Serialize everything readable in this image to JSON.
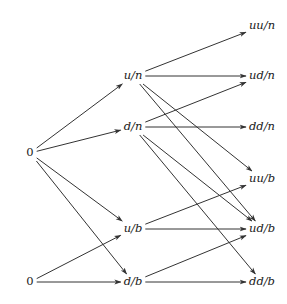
{
  "diagram": {
    "type": "directed-graph",
    "columns": 3,
    "nodes": [
      {
        "id": "root_top",
        "label": "0",
        "x": 30,
        "y": 153,
        "column": 0
      },
      {
        "id": "root_bottom",
        "label": "0",
        "x": 30,
        "y": 282,
        "column": 0
      },
      {
        "id": "u_n",
        "label": "u/n",
        "x": 133,
        "y": 76,
        "column": 1
      },
      {
        "id": "d_n",
        "label": "d/n",
        "x": 133,
        "y": 127,
        "column": 1
      },
      {
        "id": "u_b",
        "label": "u/b",
        "x": 133,
        "y": 229,
        "column": 1
      },
      {
        "id": "d_b",
        "label": "d/b",
        "x": 133,
        "y": 282,
        "column": 1
      },
      {
        "id": "uu_n",
        "label": "uu/n",
        "x": 262,
        "y": 26,
        "column": 2
      },
      {
        "id": "ud_n",
        "label": "ud/n",
        "x": 262,
        "y": 76,
        "column": 2
      },
      {
        "id": "dd_n",
        "label": "dd/n",
        "x": 262,
        "y": 127,
        "column": 2
      },
      {
        "id": "uu_b",
        "label": "uu/b",
        "x": 262,
        "y": 179,
        "column": 2
      },
      {
        "id": "ud_b",
        "label": "ud/b",
        "x": 262,
        "y": 229,
        "column": 2
      },
      {
        "id": "dd_b",
        "label": "dd/b",
        "x": 262,
        "y": 282,
        "column": 2
      }
    ],
    "edges": [
      {
        "from": "root_top",
        "to": "u_n"
      },
      {
        "from": "root_top",
        "to": "d_n"
      },
      {
        "from": "root_top",
        "to": "u_b"
      },
      {
        "from": "root_top",
        "to": "d_b"
      },
      {
        "from": "root_bottom",
        "to": "u_b"
      },
      {
        "from": "root_bottom",
        "to": "d_b"
      },
      {
        "from": "u_n",
        "to": "uu_n"
      },
      {
        "from": "u_n",
        "to": "ud_n"
      },
      {
        "from": "u_n",
        "to": "uu_b"
      },
      {
        "from": "u_n",
        "to": "ud_b"
      },
      {
        "from": "d_n",
        "to": "ud_n"
      },
      {
        "from": "d_n",
        "to": "dd_n"
      },
      {
        "from": "d_n",
        "to": "ud_b"
      },
      {
        "from": "d_n",
        "to": "dd_b"
      },
      {
        "from": "u_b",
        "to": "uu_b"
      },
      {
        "from": "u_b",
        "to": "ud_b"
      },
      {
        "from": "d_b",
        "to": "ud_b"
      },
      {
        "from": "d_b",
        "to": "dd_b"
      }
    ],
    "colors": {
      "edge": "#333333",
      "text": "#1a1a1a",
      "background": "#ffffff"
    }
  }
}
